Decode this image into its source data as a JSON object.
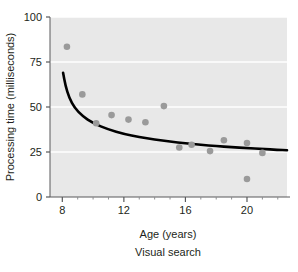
{
  "chart_data": {
    "type": "scatter",
    "title": "",
    "caption": "Visual search",
    "xlabel": "Age (years)",
    "ylabel": "Processing time (milliseconds)",
    "xlim": [
      7.2,
      22.6
    ],
    "ylim": [
      0,
      100
    ],
    "xticks": [
      8,
      12,
      16,
      20
    ],
    "xtick_labels": [
      "8",
      "12",
      "16",
      "20"
    ],
    "yticks": [
      0,
      25,
      50,
      75,
      100
    ],
    "ytick_labels": [
      "0",
      "25",
      "50",
      "75",
      "100"
    ],
    "minor_xticks": [
      9,
      10,
      11,
      13,
      14,
      15,
      17,
      18,
      19,
      21,
      22
    ],
    "grid": "horizontal-white-gridlines",
    "legend": "none",
    "plot_background_color": "#e8e8e8",
    "point_color": "#9a9a9a",
    "curve_color": "#000000",
    "axis_color": "#58595b",
    "text_color": "#231f20",
    "points": [
      {
        "x": 8.3,
        "y": 83.5
      },
      {
        "x": 9.3,
        "y": 57.0
      },
      {
        "x": 10.2,
        "y": 41.0
      },
      {
        "x": 11.2,
        "y": 45.5
      },
      {
        "x": 12.3,
        "y": 43.0
      },
      {
        "x": 13.4,
        "y": 41.5
      },
      {
        "x": 14.6,
        "y": 50.5
      },
      {
        "x": 15.6,
        "y": 27.5
      },
      {
        "x": 16.4,
        "y": 29.0
      },
      {
        "x": 17.6,
        "y": 25.5
      },
      {
        "x": 18.5,
        "y": 31.5
      },
      {
        "x": 20.0,
        "y": 30.0
      },
      {
        "x": 20.0,
        "y": 10.0
      },
      {
        "x": 21.0,
        "y": 24.5
      }
    ],
    "fit_curve": {
      "description": "decreasing power-law trend line",
      "points": [
        {
          "x": 8.05,
          "y": 69.0
        },
        {
          "x": 8.2,
          "y": 62.0
        },
        {
          "x": 8.45,
          "y": 55.0
        },
        {
          "x": 8.8,
          "y": 49.5
        },
        {
          "x": 9.3,
          "y": 45.0
        },
        {
          "x": 10.0,
          "y": 41.0
        },
        {
          "x": 11.0,
          "y": 37.5
        },
        {
          "x": 12.0,
          "y": 35.0
        },
        {
          "x": 13.0,
          "y": 33.3
        },
        {
          "x": 14.0,
          "y": 32.0
        },
        {
          "x": 15.0,
          "y": 30.8
        },
        {
          "x": 16.0,
          "y": 29.8
        },
        {
          "x": 17.0,
          "y": 29.0
        },
        {
          "x": 18.0,
          "y": 28.3
        },
        {
          "x": 19.0,
          "y": 27.7
        },
        {
          "x": 20.0,
          "y": 27.2
        },
        {
          "x": 21.0,
          "y": 26.7
        },
        {
          "x": 22.0,
          "y": 26.2
        },
        {
          "x": 22.6,
          "y": 26.0
        }
      ]
    }
  }
}
